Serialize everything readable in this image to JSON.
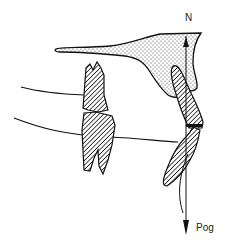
{
  "diagram": {
    "type": "cephalometric-dental-schematic",
    "labels": {
      "top_point": "N",
      "bottom_point": "Pog"
    },
    "elements": [
      "maxilla-stippled-region",
      "upper-molar-hatched",
      "lower-molar-hatched",
      "upper-incisor-hatched",
      "lower-incisor-hatched",
      "upper-occlusal-curve",
      "lower-occlusal-curve",
      "n-pog-reference-line",
      "soft-tissue-chin-curve"
    ],
    "colors": {
      "ink": "#111111",
      "background": "#ffffff"
    }
  }
}
